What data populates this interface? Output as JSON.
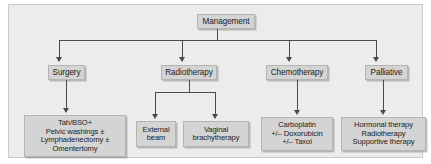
{
  "figure": {
    "colors": {
      "panel_background": "#ececec",
      "node_fill": "#d4d4d4",
      "node_border": "#b4b4b4",
      "connector": "#4a4a4a",
      "text": "#1b1b1b"
    }
  },
  "nodes": {
    "management": {
      "label": "Management"
    },
    "surgery": {
      "label": "Surgery"
    },
    "radiotherapy": {
      "label": "Radiotherapy"
    },
    "chemotherapy": {
      "label": "Chemotherapy"
    },
    "palliative": {
      "label": "Palliative"
    },
    "surgery_detail": {
      "lines": [
        "Tah/BSO+",
        "Pelvic washings ±",
        "Lymphadenectomy ±",
        "Omentertomy"
      ]
    },
    "external_beam": {
      "lines": [
        "External",
        "beam"
      ]
    },
    "vaginal_brachytherapy": {
      "lines": [
        "Vaginal",
        "brachytherapy"
      ]
    },
    "chemotherapy_detail": {
      "lines": [
        "Carboplatin",
        "+/– Doxorubicin",
        "+/– Taxol"
      ]
    },
    "palliative_detail": {
      "lines": [
        "Hormonal therapy",
        "Radiotherapy",
        "Supportive therapy"
      ]
    }
  }
}
